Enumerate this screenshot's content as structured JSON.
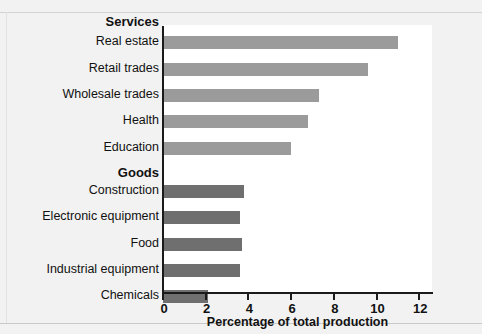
{
  "chart_data": {
    "type": "bar",
    "orientation": "horizontal",
    "title": "",
    "xlabel": "Percentage of total production",
    "ylabel": "",
    "xlim": [
      0,
      12.65
    ],
    "xticks": [
      0,
      2,
      4,
      6,
      8,
      10,
      12
    ],
    "xtick_labels": [
      "0",
      "2",
      "4",
      "6",
      "8",
      "10",
      "12"
    ],
    "grid": false,
    "legend": null,
    "groups": [
      {
        "name": "Services",
        "color": "#9b9b9b",
        "categories": [
          "Real estate",
          "Retail trades",
          "Wholesale trades",
          "Health",
          "Education"
        ],
        "values": [
          11.0,
          9.6,
          7.3,
          6.8,
          6.0
        ]
      },
      {
        "name": "Goods",
        "color": "#6f6f6f",
        "categories": [
          "Construction",
          "Electronic equipment",
          "Food",
          "Industrial equipment",
          "Chemicals"
        ],
        "values": [
          3.8,
          3.6,
          3.7,
          3.6,
          2.1
        ]
      }
    ],
    "categories": [
      "Real estate",
      "Retail trades",
      "Wholesale trades",
      "Health",
      "Education",
      "Construction",
      "Electronic equipment",
      "Food",
      "Industrial equipment",
      "Chemicals"
    ],
    "values": [
      11.0,
      9.6,
      7.3,
      6.8,
      6.0,
      3.8,
      3.6,
      3.7,
      3.6,
      2.1
    ]
  },
  "rows": [
    {
      "kind": "group",
      "label": "Services",
      "value": null,
      "color": null,
      "top": 14
    },
    {
      "kind": "bar",
      "label": "Real estate",
      "value": 11.0,
      "color": "#9b9b9b",
      "top": 36
    },
    {
      "kind": "bar",
      "label": "Retail trades",
      "value": 9.6,
      "color": "#9b9b9b",
      "top": 63
    },
    {
      "kind": "bar",
      "label": "Wholesale trades",
      "value": 7.3,
      "color": "#9b9b9b",
      "top": 89
    },
    {
      "kind": "bar",
      "label": "Health",
      "value": 6.8,
      "color": "#9b9b9b",
      "top": 115
    },
    {
      "kind": "bar",
      "label": "Education",
      "value": 6.0,
      "color": "#9b9b9b",
      "top": 142
    },
    {
      "kind": "group",
      "label": "Goods",
      "value": null,
      "color": null,
      "top": 165
    },
    {
      "kind": "bar",
      "label": "Construction",
      "value": 3.8,
      "color": "#6f6f6f",
      "top": 185
    },
    {
      "kind": "bar",
      "label": "Electronic equipment",
      "value": 3.6,
      "color": "#6f6f6f",
      "top": 211
    },
    {
      "kind": "bar",
      "label": "Food",
      "value": 3.7,
      "color": "#6f6f6f",
      "top": 238
    },
    {
      "kind": "bar",
      "label": "Industrial equipment",
      "value": 3.6,
      "color": "#6f6f6f",
      "top": 264
    },
    {
      "kind": "bar",
      "label": "Chemicals",
      "value": 2.1,
      "color": "#6f6f6f",
      "top": 290
    }
  ],
  "axis": {
    "title": "Percentage of total production",
    "ticks": [
      "0",
      "2",
      "4",
      "6",
      "8",
      "10",
      "12"
    ],
    "tick_values": [
      0,
      2,
      4,
      6,
      8,
      10,
      12
    ]
  },
  "colors": {
    "services_bar": "#9b9b9b",
    "goods_bar": "#6f6f6f",
    "axis": "#1a1a1a",
    "panel": "#ffffff",
    "background": "#f2f2f2"
  },
  "footnote": ""
}
